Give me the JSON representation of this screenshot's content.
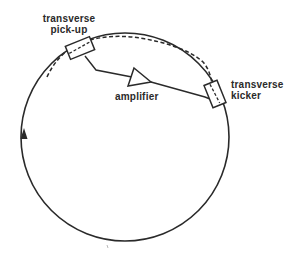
{
  "diagram": {
    "type": "stochastic-cooling-schematic",
    "labels": {
      "pickup": {
        "line1": "transverse",
        "line2": "pick-up"
      },
      "amplifier": "amplifier",
      "kicker": {
        "line1": "transverse",
        "line2": "kicker"
      }
    },
    "components": [
      {
        "id": "ring",
        "shape": "circle",
        "description": "storage ring with circulation direction arrow"
      },
      {
        "id": "pickup",
        "shape": "rectangle",
        "label": "transverse pick-up"
      },
      {
        "id": "amplifier",
        "shape": "triangle",
        "label": "amplifier"
      },
      {
        "id": "kicker",
        "shape": "rectangle",
        "label": "transverse kicker"
      },
      {
        "id": "beam-trajectory",
        "shape": "dashed-curve",
        "description": "particle betatron trajectory between pick-up and kicker"
      }
    ],
    "colors": {
      "line": "#2a2a2a",
      "background": "#ffffff"
    }
  }
}
